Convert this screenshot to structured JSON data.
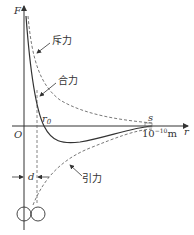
{
  "diagram": {
    "axes": {
      "y_label": "F",
      "x_label": "r",
      "origin_label": "O"
    },
    "curves": {
      "repulsive_label": "斥力",
      "net_label": "合力",
      "attractive_label": "引力"
    },
    "markers": {
      "r0_label": "r",
      "r0_sub": "0",
      "s_label": "s",
      "scale_label": "10",
      "scale_exp": "−10",
      "scale_unit": "m",
      "d_label": "d"
    },
    "colors": {
      "line": "#333333",
      "dashed": "#555555"
    }
  }
}
